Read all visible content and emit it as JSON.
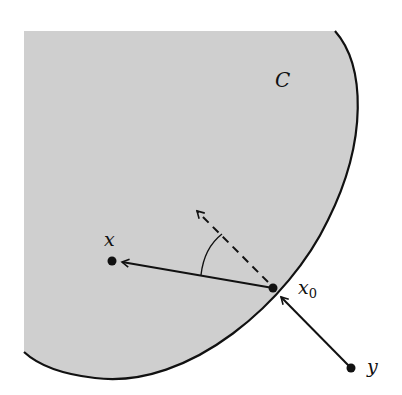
{
  "figure": {
    "set_label": "C",
    "points": {
      "x": {
        "label": "x"
      },
      "x0": {
        "label": "x",
        "subscript": "0"
      },
      "y": {
        "label": "y"
      }
    },
    "colors": {
      "region_fill": "#cfcfcf",
      "stroke": "#111111",
      "background": "#ffffff"
    }
  }
}
